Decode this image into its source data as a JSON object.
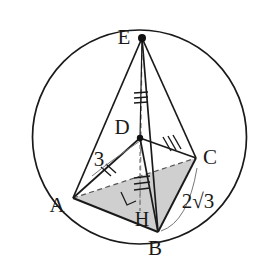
{
  "figure": {
    "type": "geometry-diagram",
    "background_color": "#ffffff",
    "stroke_color": "#1a1a1a",
    "shade_color": "#cfcfcf",
    "dashed_color": "#8a8a8a"
  },
  "circle": {
    "name": "circumscribed-circle",
    "cx": 139.5,
    "cy": 137,
    "r": 107
  },
  "points": {
    "E": {
      "label": "E",
      "x": 142,
      "y": 38,
      "label_x": 124,
      "label_y": 38,
      "dot": true
    },
    "D": {
      "label": "D",
      "x": 140,
      "y": 138,
      "label_x": 122,
      "label_y": 131,
      "dot": true
    },
    "C": {
      "label": "C",
      "x": 196,
      "y": 158,
      "label_x": 210,
      "label_y": 156,
      "dot": false
    },
    "A": {
      "label": "A",
      "x": 73,
      "y": 198,
      "label_x": 56,
      "label_y": 207,
      "dot": false
    },
    "B": {
      "label": "B",
      "x": 158,
      "y": 232,
      "label_x": 152,
      "label_y": 250,
      "dot": false
    },
    "H": {
      "label": "H",
      "x": 140,
      "y": 210,
      "label_x": 140,
      "label_y": 222,
      "dot": false
    }
  },
  "measures": {
    "side_ad": {
      "text": "3",
      "x": 98,
      "y": 163
    },
    "side_bc": {
      "text": "2√3",
      "x": 196,
      "y": 203
    }
  },
  "segments": [
    {
      "name": "edge-EA",
      "from": "E",
      "to": "A",
      "style": "solid"
    },
    {
      "name": "edge-EB",
      "from": "E",
      "to": "B",
      "style": "solid"
    },
    {
      "name": "edge-EC",
      "from": "E",
      "to": "C",
      "style": "solid"
    },
    {
      "name": "edge-ED",
      "from": "E",
      "to": "D",
      "style": "solid"
    },
    {
      "name": "edge-EH-altitude",
      "from": "E",
      "to": "H",
      "style": "dashed"
    },
    {
      "name": "edge-AD",
      "from": "A",
      "to": "D",
      "style": "solid"
    },
    {
      "name": "edge-DC",
      "from": "D",
      "to": "C",
      "style": "solid"
    },
    {
      "name": "edge-DB",
      "from": "D",
      "to": "B",
      "style": "solid"
    },
    {
      "name": "edge-AB",
      "from": "A",
      "to": "B",
      "style": "solid"
    },
    {
      "name": "edge-BC",
      "from": "B",
      "to": "C",
      "style": "solid"
    },
    {
      "name": "edge-AC-hidden",
      "from": "A",
      "to": "C",
      "style": "dashed"
    },
    {
      "name": "edge-DH",
      "from": "D",
      "to": "H",
      "style": "dashed"
    }
  ],
  "faces": [
    {
      "name": "shaded-base-ABC",
      "vertices": [
        "A",
        "B",
        "C"
      ],
      "fill": "#cfcfcf"
    }
  ],
  "marks": {
    "tick_ad": {
      "name": "tick-marks-AD",
      "count": 2
    },
    "tick_dc": {
      "name": "tick-marks-DC",
      "count": 3
    },
    "tick_dh": {
      "name": "tick-marks-DH",
      "count": 3
    },
    "tick_eh": {
      "name": "tick-marks-EH",
      "count": 3
    },
    "right_angle_h": {
      "name": "right-angle-marker-H",
      "present": true
    }
  }
}
